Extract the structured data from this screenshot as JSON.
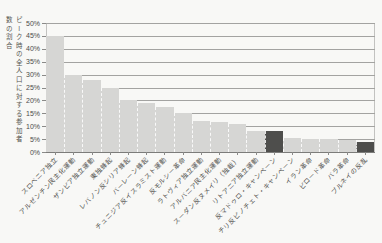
{
  "figure": {
    "background": "#f8f8f6"
  },
  "chart_data": {
    "type": "bar",
    "title": "",
    "ylabel": "ピーク時の全人口に対する参加者数の割合",
    "xlabel": "",
    "ylim": [
      0,
      50
    ],
    "yticks": [
      0,
      5,
      10,
      15,
      20,
      25,
      30,
      35,
      40,
      45,
      50
    ],
    "ytick_suffix": "%",
    "grid": true,
    "legend": "none",
    "categories": [
      "スロベニア独立",
      "アルゼンチン民主化運動",
      "ザンビア独立運動",
      "東独蜂起",
      "レバノン反シリア蜂起",
      "バーレーン蜂起",
      "チュニジア反イスラミスト運動",
      "反モルシー革命",
      "ラトヴィア独立運動",
      "アルバニア民主化運動",
      "スーダン反ヌメイリ（独裁）",
      "リトアニア独立運動",
      "反マドゥロ・キャンペーン",
      "チリ反ピノチェト・キャンペーン",
      "イラン革命",
      "ビロード革命",
      "バラ革命",
      "ブルネイの反乱"
    ],
    "values": [
      45,
      30,
      28,
      25,
      20,
      19,
      17.5,
      15,
      12,
      11.5,
      11,
      8,
      8,
      5.5,
      5,
      5,
      4.5,
      4
    ],
    "highlight_indices": [
      12,
      17
    ],
    "colors": {
      "bar": "#d6d6d4",
      "bar_highlight": "#4e4e4c",
      "grid": "#a3a3a1",
      "axis": "#7c7c7a",
      "text": "#4c4c4a"
    }
  }
}
